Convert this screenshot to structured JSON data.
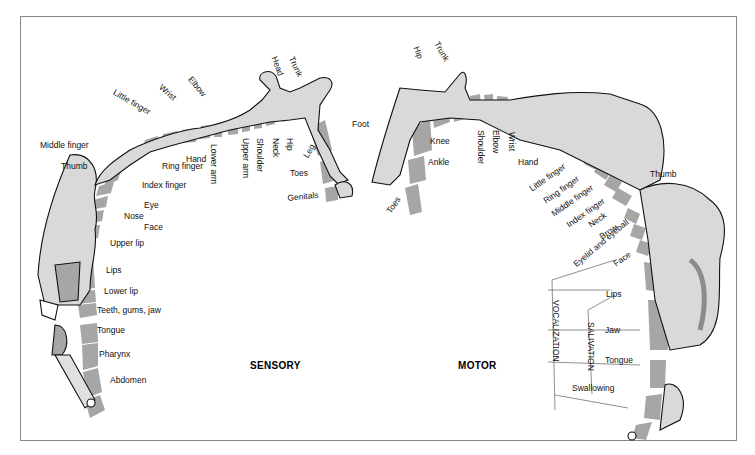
{
  "diagram": {
    "type": "cortical homunculus",
    "colors": {
      "body_fill": "#d9d9d9",
      "band": "#a6a6a6",
      "band_dark": "#8c8c8c",
      "outline": "#111111",
      "frame": "#888888"
    },
    "sensory": {
      "title": "SENSORY",
      "labels": [
        "Little finger",
        "Wrist",
        "Elbow",
        "Head",
        "Trunk",
        "Foot",
        "Middle finger",
        "Hand",
        "Lower arm",
        "Upper arm",
        "Shoulder",
        "Neck",
        "Hip",
        "Leg",
        "Thumb",
        "Ring finger",
        "Index finger",
        "Toes",
        "Genitals",
        "Eye",
        "Nose",
        "Face",
        "Upper lip",
        "Lips",
        "Lower lip",
        "Teeth, gums, jaw",
        "Tongue",
        "Pharynx",
        "Abdomen"
      ]
    },
    "motor": {
      "title": "MOTOR",
      "labels": [
        "Hip",
        "Trunk",
        "Knee",
        "Shoulder",
        "Elbow",
        "Wrist",
        "Ankle",
        "Hand",
        "Toes",
        "Little finger",
        "Ring finger",
        "Middle finger",
        "Index finger",
        "Thumb",
        "Neck",
        "Brow",
        "Eyelid and eyeball",
        "Face",
        "Lips",
        "Jaw",
        "Tongue",
        "Swallowing"
      ],
      "groups": [
        "VOCALIZATION",
        "SALIVATION"
      ]
    }
  }
}
